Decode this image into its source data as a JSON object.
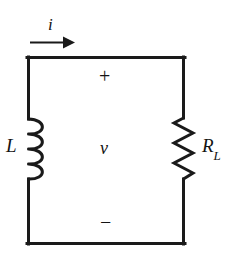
{
  "figure": {
    "type": "circuit-schematic",
    "background_color": "#ffffff",
    "line_color": "#1a1a1a"
  },
  "labels": {
    "current": "i",
    "inductor": "L",
    "resistor_main": "R",
    "resistor_subscript": "L",
    "voltage": "v",
    "polarity_positive": "+",
    "polarity_negative": "−"
  },
  "components": [
    {
      "name": "inductor",
      "symbol": "coil",
      "label": "L",
      "position": "left-branch",
      "coil_count": 4
    },
    {
      "name": "resistor",
      "symbol": "zigzag",
      "label": "R_L",
      "position": "right-branch",
      "zigzag_segments": 6
    },
    {
      "name": "current-arrow",
      "symbol": "arrow-right",
      "label": "i",
      "position": "above-top-wire",
      "direction": "right"
    }
  ],
  "loop": {
    "left": 27,
    "top": 57,
    "right": 185,
    "bottom": 243
  }
}
